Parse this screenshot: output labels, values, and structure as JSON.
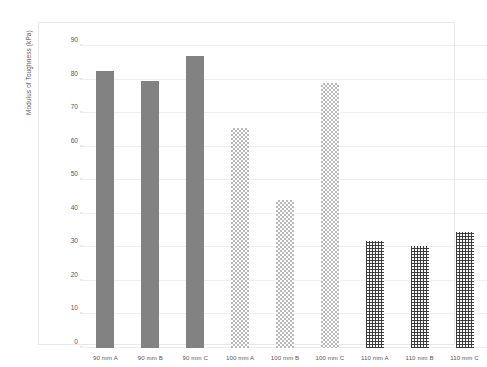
{
  "chart_data": {
    "type": "bar",
    "title": "",
    "xlabel": "",
    "ylabel": "Modulus of Toughness (kPa)",
    "categories": [
      "90 mm A",
      "90 mm B",
      "90 mm C",
      "100 mm A",
      "100 mm B",
      "100 mm C",
      "110 mm A",
      "110 mm B",
      "110 mm C"
    ],
    "values": [
      82.5,
      79.5,
      87.0,
      65.5,
      44.0,
      79.0,
      32.0,
      30.5,
      34.5
    ],
    "ylim": [
      0,
      90
    ],
    "yticks": [
      0,
      10,
      20,
      30,
      40,
      50,
      60,
      70,
      80,
      90
    ],
    "ytick_labels": [
      "0",
      "10",
      "20",
      "30",
      "40",
      "50",
      "60",
      "70",
      "80",
      "90"
    ],
    "grid": true,
    "legend": "none",
    "bar_styles": [
      "solid",
      "solid",
      "solid",
      "checker",
      "checker",
      "checker",
      "cross",
      "cross",
      "cross"
    ],
    "colors": {
      "solid_fill": "#828282",
      "checker_fill": "#b9b9b9",
      "cross_fill": "#3c3c3c",
      "gridline": "#efefef",
      "frame": "#e8e8e8",
      "text": "#58585a",
      "background": "#ffffff"
    }
  },
  "caption": {
    "text": ""
  }
}
